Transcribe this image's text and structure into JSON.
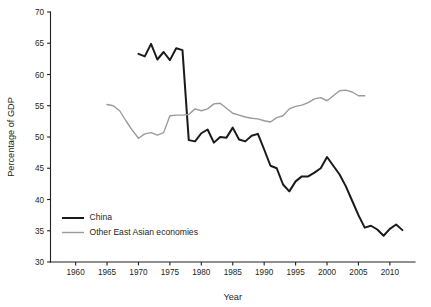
{
  "chart_data": {
    "type": "line",
    "title": "",
    "xlabel": "Year",
    "ylabel": "Percentage of GDP",
    "xlim": [
      1956,
      2014
    ],
    "ylim": [
      30,
      70
    ],
    "xticks": [
      1960,
      1965,
      1970,
      1975,
      1980,
      1985,
      1990,
      1995,
      2000,
      2005,
      2010
    ],
    "yticks": [
      30,
      35,
      40,
      45,
      50,
      55,
      60,
      65,
      70
    ],
    "grid": false,
    "legend_position": "lower-left-inside",
    "series": [
      {
        "name": "China",
        "color": "#1a1a1a",
        "x": [
          1970,
          1971,
          1972,
          1973,
          1974,
          1975,
          1976,
          1977,
          1978,
          1979,
          1980,
          1981,
          1982,
          1983,
          1984,
          1985,
          1986,
          1987,
          1988,
          1989,
          1990,
          1991,
          1992,
          1993,
          1994,
          1995,
          1996,
          1997,
          1998,
          1999,
          2000,
          2001,
          2002,
          2003,
          2004,
          2005,
          2006,
          2007,
          2008,
          2009,
          2010,
          2011,
          2012
        ],
        "values": [
          63.3,
          62.9,
          64.9,
          62.4,
          63.6,
          62.3,
          64.2,
          63.9,
          49.5,
          49.3,
          50.6,
          51.2,
          49.1,
          50.0,
          49.9,
          51.5,
          49.6,
          49.3,
          50.2,
          50.5,
          48.0,
          45.4,
          45.0,
          42.4,
          41.3,
          42.9,
          43.7,
          43.7,
          44.3,
          45.0,
          46.8,
          45.4,
          44.0,
          42.1,
          39.8,
          37.5,
          35.5,
          35.8,
          35.2,
          34.2,
          35.3,
          36.0,
          35.1
        ]
      },
      {
        "name": "Other East Asian economies",
        "color": "#9a9a9a",
        "x": [
          1965,
          1966,
          1967,
          1968,
          1969,
          1970,
          1971,
          1972,
          1973,
          1974,
          1975,
          1976,
          1977,
          1978,
          1979,
          1980,
          1981,
          1982,
          1983,
          1984,
          1985,
          1986,
          1987,
          1988,
          1989,
          1990,
          1991,
          1992,
          1993,
          1994,
          1995,
          1996,
          1997,
          1998,
          1999,
          2000,
          2001,
          2002,
          2003,
          2004,
          2005,
          2006
        ],
        "values": [
          55.2,
          55.0,
          54.2,
          52.6,
          51.1,
          49.8,
          50.5,
          50.7,
          50.3,
          50.7,
          53.4,
          53.5,
          53.5,
          53.6,
          54.5,
          54.2,
          54.5,
          55.3,
          55.4,
          54.6,
          53.8,
          53.5,
          53.2,
          53.0,
          52.9,
          52.6,
          52.4,
          53.1,
          53.4,
          54.5,
          54.9,
          55.1,
          55.5,
          56.1,
          56.3,
          55.8,
          56.6,
          57.4,
          57.5,
          57.2,
          56.6,
          56.6
        ]
      }
    ]
  },
  "legend": {
    "items": [
      {
        "label": "China"
      },
      {
        "label": "Other East Asian economies"
      }
    ]
  }
}
